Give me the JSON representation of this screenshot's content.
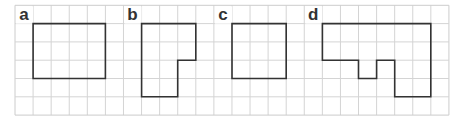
{
  "grid": {
    "origin_x": 15,
    "origin_y": 5.3,
    "cell_w": 18.08,
    "cell_h": 18.3,
    "cols": 24,
    "rows": 6,
    "line_color": "#d4d4d4",
    "border_color": "#cccccc"
  },
  "shape_style": {
    "stroke": "#333333",
    "stroke_width": 1.6
  },
  "figures": [
    {
      "label": "a",
      "label_cell": [
        0,
        0
      ],
      "points": [
        [
          1,
          1
        ],
        [
          5,
          1
        ],
        [
          5,
          4
        ],
        [
          1,
          4
        ]
      ]
    },
    {
      "label": "b",
      "label_cell": [
        6,
        0
      ],
      "points": [
        [
          7,
          1
        ],
        [
          10,
          1
        ],
        [
          10,
          3
        ],
        [
          9,
          3
        ],
        [
          9,
          5
        ],
        [
          7,
          5
        ]
      ]
    },
    {
      "label": "c",
      "label_cell": [
        11,
        0
      ],
      "points": [
        [
          12,
          1
        ],
        [
          15,
          1
        ],
        [
          15,
          4
        ],
        [
          12,
          4
        ]
      ]
    },
    {
      "label": "d",
      "label_cell": [
        16,
        0
      ],
      "points": [
        [
          17,
          1
        ],
        [
          23,
          1
        ],
        [
          23,
          5
        ],
        [
          21,
          5
        ],
        [
          21,
          3
        ],
        [
          20,
          3
        ],
        [
          20,
          4
        ],
        [
          19,
          4
        ],
        [
          19,
          3
        ],
        [
          17,
          3
        ]
      ]
    }
  ]
}
